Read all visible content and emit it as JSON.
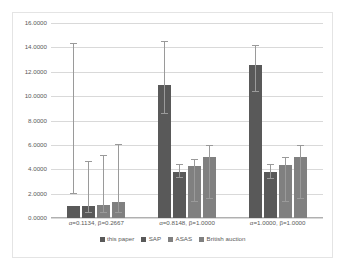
{
  "chart_data": {
    "type": "bar",
    "title": "",
    "subtitle": "",
    "xlabel": "",
    "ylabel": "",
    "ylim": [
      0,
      16
    ],
    "ytick_step": 2,
    "grid": true,
    "legend_position": "bottom",
    "tick_format": "0.0000",
    "yticks": [
      "16.0000",
      "14.0000",
      "12.0000",
      "10.0000",
      "8.0000",
      "6.0000",
      "4.0000",
      "2.0000",
      "0.0000"
    ],
    "ytick_values": [
      16,
      14,
      12,
      10,
      8,
      6,
      4,
      2,
      0
    ],
    "categories": [
      "α=0.1134, β=0.2667",
      "α=0.8148, β=1.0000",
      "α=1.0000, β=1.0000"
    ],
    "series": [
      {
        "name": "this paper",
        "color": "#595959",
        "values": [
          1.0,
          10.9,
          12.55
        ],
        "err_low": [
          1.95,
          8.55,
          10.35
        ],
        "err_high": [
          14.3,
          14.45,
          14.1
        ]
      },
      {
        "name": "SAP",
        "color": "#595959",
        "values": [
          1.0,
          3.8,
          3.78
        ],
        "err_low": [
          0.42,
          3.25,
          3.2
        ],
        "err_high": [
          4.6,
          4.35,
          4.35
        ]
      },
      {
        "name": "ASAS",
        "color": "#808080",
        "values": [
          1.05,
          4.25,
          4.35
        ],
        "err_low": [
          0.4,
          1.3,
          1.3
        ],
        "err_high": [
          5.1,
          4.8,
          4.95
        ]
      },
      {
        "name": "British auction",
        "color": "#808080",
        "values": [
          1.3,
          5.0,
          5.0
        ],
        "err_low": [
          0.45,
          1.6,
          1.6
        ],
        "err_high": [
          5.95,
          5.9,
          5.9
        ]
      }
    ]
  }
}
